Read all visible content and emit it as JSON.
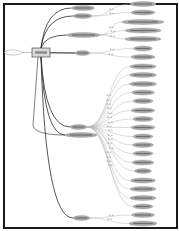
{
  "diagram": {
    "type": "graph",
    "note": "node labels illegible at source resolution",
    "colors": {
      "node_fill": "#a9a9a9",
      "node_stroke": "#8a8a8a",
      "edge_strong": "#2b2b2b",
      "edge_light": "#b5b5b5",
      "frame": "#1a1a1a"
    },
    "source_node": {
      "id": "src",
      "label": "…",
      "x": 13,
      "y": 52.5,
      "rx": 8.5,
      "ry": 2.6
    },
    "hub": {
      "id": "hub",
      "label": "…",
      "x": 32,
      "y": 48,
      "w": 18,
      "h": 9
    },
    "level1": [
      {
        "id": "a",
        "label": "…",
        "x": 83,
        "y": 8,
        "rx": 11.5,
        "ry": 2.6
      },
      {
        "id": "b",
        "label": "…",
        "x": 82.5,
        "y": 16,
        "rx": 9.5,
        "ry": 2.6
      },
      {
        "id": "c",
        "label": "…",
        "x": 83.5,
        "y": 35,
        "rx": 16.5,
        "ry": 2.6
      },
      {
        "id": "d",
        "label": "…",
        "x": 82.5,
        "y": 53,
        "rx": 7.5,
        "ry": 2.6
      },
      {
        "id": "e",
        "label": "…",
        "x": 78.5,
        "y": 127,
        "rx": 8.5,
        "ry": 2.6
      },
      {
        "id": "f",
        "label": "…",
        "x": 81,
        "y": 135,
        "rx": 16,
        "ry": 2.6
      },
      {
        "id": "g",
        "label": "…",
        "x": 81.5,
        "y": 218,
        "rx": 8.5,
        "ry": 2.6
      }
    ],
    "leaves": [
      {
        "parent": "b",
        "x": 143,
        "y": 4,
        "rx": 13
      },
      {
        "parent": "b",
        "x": 143,
        "y": 12.5,
        "rx": 12
      },
      {
        "parent": "c",
        "x": 143,
        "y": 22,
        "rx": 21
      },
      {
        "parent": "c",
        "x": 143,
        "y": 30.5,
        "rx": 18
      },
      {
        "parent": "c",
        "x": 143,
        "y": 39,
        "rx": 18
      },
      {
        "parent": "d",
        "x": 143,
        "y": 48.5,
        "rx": 9.5
      },
      {
        "parent": "d",
        "x": 143,
        "y": 57,
        "rx": 12
      },
      {
        "parent": "e",
        "x": 143,
        "y": 66.5,
        "rx": 13
      },
      {
        "parent": "e",
        "x": 143,
        "y": 75,
        "rx": 13.5
      },
      {
        "parent": "e",
        "x": 143,
        "y": 84,
        "rx": 13.5
      },
      {
        "parent": "e",
        "x": 143,
        "y": 92.5,
        "rx": 11.5
      },
      {
        "parent": "e",
        "x": 143,
        "y": 101,
        "rx": 10
      },
      {
        "parent": "e",
        "x": 143,
        "y": 110.5,
        "rx": 12
      },
      {
        "parent": "e",
        "x": 143,
        "y": 119,
        "rx": 10
      },
      {
        "parent": "e",
        "x": 143,
        "y": 127.5,
        "rx": 12
      },
      {
        "parent": "e",
        "x": 143,
        "y": 136.5,
        "rx": 10
      },
      {
        "parent": "e",
        "x": 143,
        "y": 145,
        "rx": 10.5
      },
      {
        "parent": "e",
        "x": 143,
        "y": 153.5,
        "rx": 10
      },
      {
        "parent": "e",
        "x": 143,
        "y": 162.5,
        "rx": 11
      },
      {
        "parent": "e",
        "x": 143,
        "y": 171,
        "rx": 8.5
      },
      {
        "parent": "e",
        "x": 143,
        "y": 180.5,
        "rx": 12.5
      },
      {
        "parent": "e",
        "x": 143,
        "y": 189,
        "rx": 13
      },
      {
        "parent": "e",
        "x": 143,
        "y": 198,
        "rx": 13
      },
      {
        "parent": "e",
        "x": 143,
        "y": 206.5,
        "rx": 10
      },
      {
        "parent": "g",
        "x": 143,
        "y": 215,
        "rx": 11.5
      },
      {
        "parent": "g",
        "x": 143,
        "y": 223.5,
        "rx": 14
      }
    ]
  }
}
